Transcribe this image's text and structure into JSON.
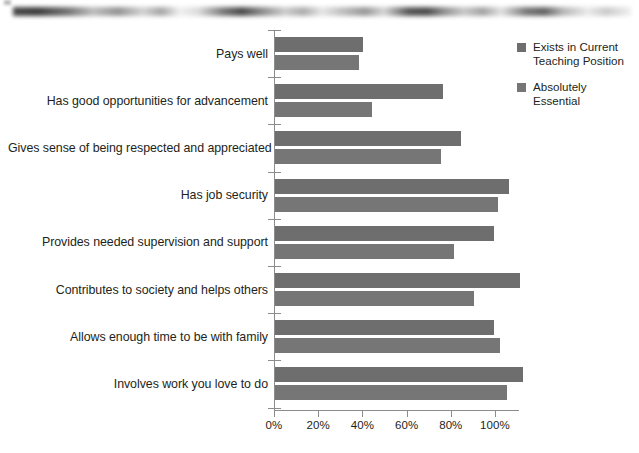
{
  "scan_artifact": {
    "name": "scanned-page-edge-smudge"
  },
  "legend": {
    "position": "top-right",
    "entries": [
      {
        "label": "Exists in Current Teaching Position",
        "color": "#6e6e6e",
        "swatch_icon": "square-swatch-icon"
      },
      {
        "label": "Absolutely Essential",
        "color": "#767676",
        "swatch_icon": "square-swatch-icon"
      }
    ]
  },
  "axis": {
    "x_tick_labels": [
      "0%",
      "20%",
      "40%",
      "60%",
      "80%",
      "100%"
    ],
    "x_tick_values": [
      0,
      20,
      40,
      60,
      80,
      100
    ]
  },
  "chart_data": {
    "type": "bar",
    "orientation": "horizontal",
    "title": "",
    "subtitle": "",
    "xlabel": "",
    "ylabel": "",
    "xlim": [
      0,
      100
    ],
    "x_unit": "%",
    "grid": false,
    "legend_position": "top-right",
    "categories": [
      "Pays well",
      "Has good opportunities for advancement",
      "Gives sense of being respected and appreciated",
      "Has job security",
      "Provides needed supervision and support",
      "Contributes to society and helps others",
      "Allows enough time to be with family",
      "Involves work you love to do"
    ],
    "series": [
      {
        "name": "Exists in Current Teaching Position",
        "color": "#6e6e6e",
        "values": [
          40,
          76,
          84,
          106,
          99,
          111,
          99,
          112
        ]
      },
      {
        "name": "Absolutely Essential",
        "color": "#767676",
        "values": [
          38,
          44,
          75,
          101,
          81,
          90,
          102,
          105
        ]
      }
    ]
  }
}
